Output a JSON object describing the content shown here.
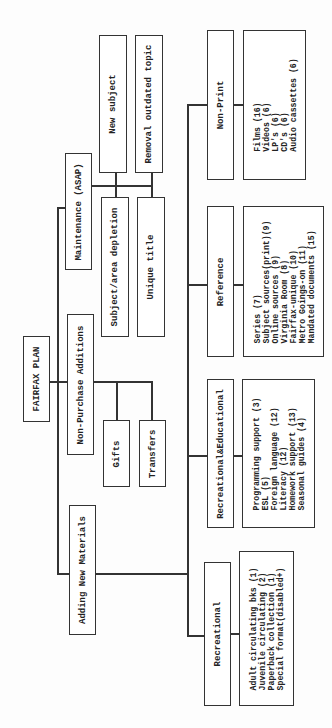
{
  "title": "FAIRFAX PLAN",
  "branches": {
    "maintenance": {
      "label": "Maintenance (ASAP)",
      "children": [
        "New subject",
        "Removal outdated topic",
        "Subject/area depletion",
        "Unique title"
      ]
    },
    "non_purchase": {
      "label": "Non-Purchase Additions",
      "children": [
        "Gifts",
        "Transfers"
      ]
    },
    "adding_new": {
      "label": "Adding New Materials",
      "categories": [
        {
          "label": "Non-Print",
          "items": [
            "Films (16)",
            "Videos (6)",
            "LP's (6)",
            "CD's (6)",
            "Audio cassettes (6)"
          ]
        },
        {
          "label": "Reference",
          "items": [
            "Series (7)",
            "Subject sources(print)(9)",
            "Online sources (9)",
            "Virginia Room (8)",
            "Fairfax-unique (10)",
            "Metro Goings-on (11)",
            "Mandated documents (15)"
          ]
        },
        {
          "label": "Recreational&Educational",
          "items": [
            "Programming support (3)",
            "ESL (5)",
            "Foreign language (12)",
            "Literacy (12)",
            "Homework support (13)",
            "Seasonal guides (4)"
          ]
        },
        {
          "label": "Recreational",
          "items": [
            "Adult circulating bks (1)",
            "Juvenile circulating (2)",
            "Paperback collection (1)",
            "Special format(disabled+)"
          ]
        }
      ]
    }
  },
  "colors": {
    "line": "#333333",
    "background": "#ffffff",
    "text": "#222222"
  }
}
